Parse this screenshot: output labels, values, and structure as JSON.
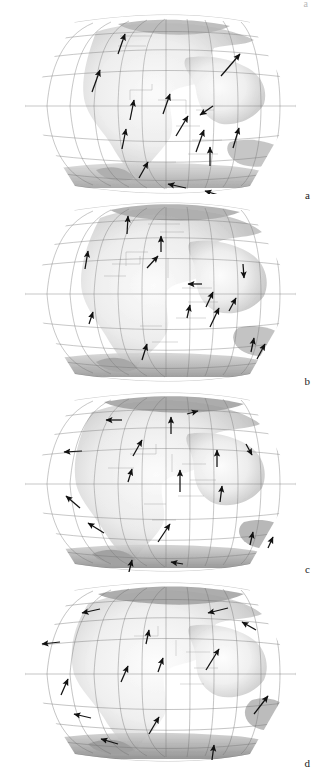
{
  "figure": {
    "type": "multi-panel-map-figure",
    "panel_count": 4,
    "projection": "flat-polar pseudocylindrical (Eckert-type) world projection",
    "corner_mark": "a",
    "panels": [
      {
        "label": "a",
        "graticule": {
          "meridian_step_deg": 20,
          "parallel_step_deg": 15,
          "pole_line": true
        },
        "vectors": [
          {
            "x": 122,
            "y": 40,
            "dx": 4,
            "dy": -14,
            "mag": 14.6
          },
          {
            "x": 232,
            "y": 48,
            "dx": 11,
            "dy": -12,
            "mag": 16.3
          },
          {
            "x": 97,
            "y": 72,
            "dx": 5,
            "dy": -13,
            "mag": 13.9
          },
          {
            "x": 167,
            "y": 92,
            "dx": 4,
            "dy": -12,
            "mag": 12.6
          },
          {
            "x": 132,
            "y": 98,
            "dx": 2,
            "dy": -12,
            "mag": 12.2
          },
          {
            "x": 204,
            "y": 97,
            "dx": -9,
            "dy": -6,
            "mag": 10.8
          },
          {
            "x": 182,
            "y": 115,
            "dx": 6,
            "dy": -11,
            "mag": 12.5
          },
          {
            "x": 124,
            "y": 127,
            "dx": 2,
            "dy": -12,
            "mag": 12.2
          },
          {
            "x": 200,
            "y": 130,
            "dx": 4,
            "dy": -14,
            "mag": 14.6
          },
          {
            "x": 236,
            "y": 127,
            "dx": 3,
            "dy": -13,
            "mag": 13.3
          },
          {
            "x": 210,
            "y": 145,
            "dx": 0,
            "dy": -12,
            "mag": 12.0
          },
          {
            "x": 143,
            "y": 158,
            "dx": 7,
            "dy": -9,
            "mag": 11.4
          },
          {
            "x": 176,
            "y": 172,
            "dx": -10,
            "dy": -3,
            "mag": 10.4
          },
          {
            "x": 213,
            "y": 180,
            "dx": -12,
            "dy": -4,
            "mag": 12.6
          }
        ]
      },
      {
        "label": "b",
        "graticule": {
          "meridian_step_deg": 20,
          "parallel_step_deg": 15,
          "pole_line": true
        },
        "vectors": [
          {
            "x": 128,
            "y": 221,
            "dx": 1,
            "dy": -12,
            "mag": 12.0
          },
          {
            "x": 161,
            "y": 240,
            "dx": 0,
            "dy": -12,
            "mag": 12.0
          },
          {
            "x": 87,
            "y": 254,
            "dx": 2,
            "dy": -14,
            "mag": 14.1
          },
          {
            "x": 154,
            "y": 271,
            "dx": 7,
            "dy": -9,
            "mag": 11.4
          },
          {
            "x": 192,
            "y": 284,
            "dx": -10,
            "dy": 0,
            "mag": 10.0
          },
          {
            "x": 244,
            "y": 268,
            "dx": 1,
            "dy": 11,
            "mag": 11.0
          },
          {
            "x": 210,
            "y": 295,
            "dx": 4,
            "dy": -12,
            "mag": 12.6
          },
          {
            "x": 189,
            "y": 310,
            "dx": 2,
            "dy": -11,
            "mag": 11.2
          },
          {
            "x": 234,
            "y": 300,
            "dx": 5,
            "dy": -11,
            "mag": 12.1
          },
          {
            "x": 216,
            "y": 313,
            "dx": 6,
            "dy": -14,
            "mag": 15.2
          },
          {
            "x": 92,
            "y": 312,
            "dx": 3,
            "dy": -10,
            "mag": 10.4
          },
          {
            "x": 145,
            "y": 348,
            "dx": 3,
            "dy": -12,
            "mag": 12.4
          },
          {
            "x": 253,
            "y": 340,
            "dx": 2,
            "dy": -12,
            "mag": 12.2
          },
          {
            "x": 262,
            "y": 345,
            "dx": 5,
            "dy": -11,
            "mag": 12.1
          }
        ]
      },
      {
        "label": "c",
        "graticule": {
          "meridian_step_deg": 20,
          "parallel_step_deg": 15,
          "pole_line": true
        },
        "vectors": [
          {
            "x": 111,
            "y": 420,
            "dx": -12,
            "dy": 0,
            "mag": 12.0
          },
          {
            "x": 171,
            "y": 421,
            "dx": 0,
            "dy": -12,
            "mag": 12.0
          },
          {
            "x": 196,
            "y": 411,
            "dx": 8,
            "dy": -2,
            "mag": 8.2
          },
          {
            "x": 70,
            "y": 452,
            "dx": -14,
            "dy": 1,
            "mag": 14.0
          },
          {
            "x": 139,
            "y": 445,
            "dx": 5,
            "dy": -12,
            "mag": 13.0
          },
          {
            "x": 217,
            "y": 457,
            "dx": 0,
            "dy": -13,
            "mag": 13.0
          },
          {
            "x": 249,
            "y": 452,
            "dx": 5,
            "dy": 8,
            "mag": 9.4
          },
          {
            "x": 131,
            "y": 473,
            "dx": 3,
            "dy": -10,
            "mag": 10.4
          },
          {
            "x": 180,
            "y": 478,
            "dx": 0,
            "dy": -16,
            "mag": 16.0
          },
          {
            "x": 221,
            "y": 492,
            "dx": 1,
            "dy": -12,
            "mag": 12.1
          },
          {
            "x": 72,
            "y": 500,
            "dx": -8,
            "dy": -8,
            "mag": 11.3
          },
          {
            "x": 94,
            "y": 527,
            "dx": -10,
            "dy": -6,
            "mag": 11.7
          },
          {
            "x": 165,
            "y": 532,
            "dx": 7,
            "dy": -13,
            "mag": 14.8
          },
          {
            "x": 252,
            "y": 537,
            "dx": 2,
            "dy": -10,
            "mag": 10.2
          },
          {
            "x": 271,
            "y": 541,
            "dx": 3,
            "dy": -8,
            "mag": 8.5
          },
          {
            "x": 175,
            "y": 562,
            "dx": -8,
            "dy": -2,
            "mag": 8.2
          },
          {
            "x": 130,
            "y": 572,
            "dx": 2,
            "dy": -11,
            "mag": 11.2
          }
        ]
      },
      {
        "label": "d",
        "graticule": {
          "meridian_step_deg": 20,
          "parallel_step_deg": 15,
          "pole_line": true
        },
        "vectors": [
          {
            "x": 86,
            "y": 612,
            "dx": -13,
            "dy": 3,
            "mag": 13.3
          },
          {
            "x": 213,
            "y": 611,
            "dx": -13,
            "dy": 3,
            "mag": 13.3
          },
          {
            "x": 245,
            "y": 625,
            "dx": -8,
            "dy": -7,
            "mag": 10.6
          },
          {
            "x": 45,
            "y": 643,
            "dx": -13,
            "dy": 1,
            "mag": 13.0
          },
          {
            "x": 148,
            "y": 634,
            "dx": 2,
            "dy": -9,
            "mag": 9.2
          },
          {
            "x": 162,
            "y": 663,
            "dx": 3,
            "dy": -11,
            "mag": 11.4
          },
          {
            "x": 216,
            "y": 653,
            "dx": 9,
            "dy": -14,
            "mag": 16.6
          },
          {
            "x": 126,
            "y": 675,
            "dx": 4,
            "dy": -13,
            "mag": 13.6
          },
          {
            "x": 66,
            "y": 688,
            "dx": 4,
            "dy": -13,
            "mag": 13.6
          },
          {
            "x": 264,
            "y": 700,
            "dx": 10,
            "dy": -12,
            "mag": 15.6
          },
          {
            "x": 81,
            "y": 716,
            "dx": -10,
            "dy": -3,
            "mag": 10.4
          },
          {
            "x": 156,
            "y": 723,
            "dx": 6,
            "dy": -11,
            "mag": 12.5
          },
          {
            "x": 108,
            "y": 740,
            "dx": -10,
            "dy": -5,
            "mag": 11.2
          },
          {
            "x": 213,
            "y": 750,
            "dx": 1,
            "dy": -10,
            "mag": 10.0
          }
        ]
      }
    ]
  }
}
